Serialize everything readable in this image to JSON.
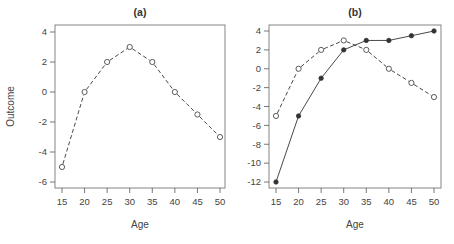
{
  "chart_data": [
    {
      "type": "line",
      "title": "(a)",
      "xlabel": "Age",
      "ylabel": "Outcome",
      "x": [
        15,
        20,
        25,
        30,
        35,
        40,
        45,
        50
      ],
      "xticks": [
        15,
        20,
        25,
        30,
        35,
        40,
        45,
        50
      ],
      "yticks": [
        4,
        2,
        0,
        -2,
        -4,
        -6
      ],
      "ylim": [
        -6.4,
        4.5
      ],
      "grid": false,
      "series": [
        {
          "name": "dashed-open",
          "style": "dashed",
          "marker": "open-circle",
          "values": [
            -5,
            0,
            2,
            3,
            2,
            0,
            -1.5,
            -3
          ]
        }
      ]
    },
    {
      "type": "line",
      "title": "(b)",
      "xlabel": "Age",
      "ylabel": "",
      "x": [
        15,
        20,
        25,
        30,
        35,
        40,
        45,
        50
      ],
      "xticks": [
        15,
        20,
        25,
        30,
        35,
        40,
        45,
        50
      ],
      "yticks": [
        4,
        2,
        0,
        -2,
        -4,
        -6,
        -8,
        -10,
        -12
      ],
      "ylim": [
        -12.7,
        4.6
      ],
      "grid": false,
      "series": [
        {
          "name": "dashed-open",
          "style": "dashed",
          "marker": "open-circle",
          "values": [
            -5,
            0,
            2,
            3,
            2,
            0,
            -1.5,
            -3
          ]
        },
        {
          "name": "solid-filled",
          "style": "solid",
          "marker": "filled-circle",
          "values": [
            -12,
            -5,
            -1,
            2,
            3,
            3,
            3.5,
            4
          ]
        }
      ]
    }
  ],
  "colors": {
    "line": "#333333",
    "axis": "#555555",
    "frame": "#666666"
  }
}
